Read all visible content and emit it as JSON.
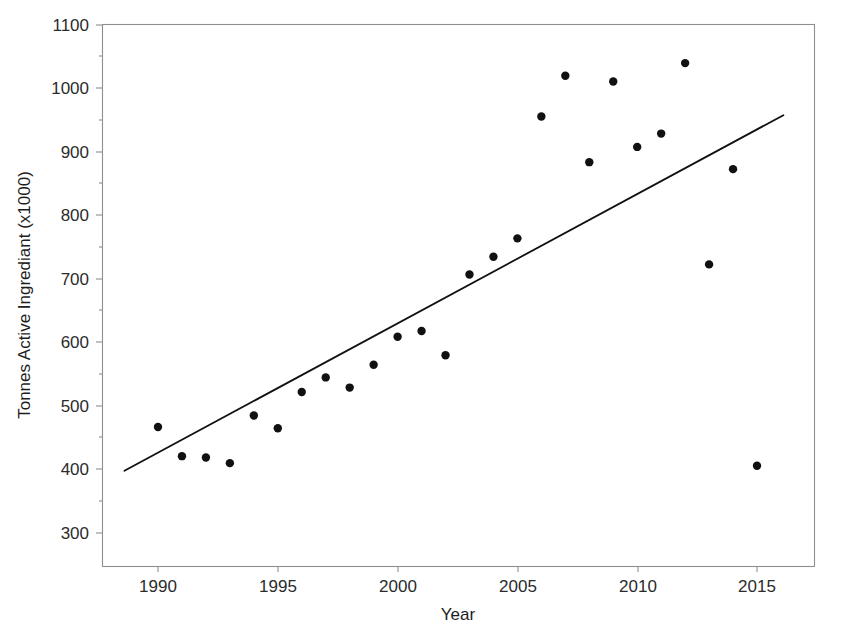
{
  "chart_data": {
    "type": "scatter",
    "title": "",
    "xlabel": "Year",
    "ylabel": "Tonnes Active Ingrediant (x1000)",
    "xlim": [
      1988.5,
      2016.5
    ],
    "ylim": [
      250,
      1100
    ],
    "grid": false,
    "legend": null,
    "xticks": [
      1990,
      1995,
      2000,
      2005,
      2010,
      2015
    ],
    "xtick_labels": [
      "1990",
      "1995",
      "2000",
      "2005",
      "2010",
      "2015"
    ],
    "yticks": [
      300,
      400,
      500,
      600,
      700,
      800,
      900,
      1000,
      1100
    ],
    "ytick_labels": [
      "300",
      "400",
      "500",
      "600",
      "700",
      "800",
      "900",
      "1000",
      "1100"
    ],
    "minor_yticks": [
      350,
      450,
      550,
      650,
      750,
      850,
      950,
      1050
    ],
    "x": [
      1990,
      1991,
      1992,
      1993,
      1994,
      1995,
      1996,
      1997,
      1998,
      1999,
      2000,
      2001,
      2002,
      2003,
      2004,
      2005,
      2006,
      2007,
      2008,
      2009,
      2010,
      2011,
      2012,
      2013,
      2014,
      2015
    ],
    "values": [
      467,
      421,
      419,
      410,
      485,
      465,
      522,
      545,
      529,
      565,
      609,
      618,
      580,
      707,
      735,
      764,
      956,
      1020,
      884,
      1011,
      908,
      929,
      1040,
      723,
      873,
      406
    ],
    "series": [
      {
        "name": "Tonnes Active Ingrediant",
        "marker": "filled-circle",
        "color": "#111111",
        "values": [
          467,
          421,
          419,
          410,
          485,
          465,
          522,
          545,
          529,
          565,
          609,
          618,
          580,
          707,
          735,
          764,
          956,
          1020,
          884,
          1011,
          908,
          929,
          1040,
          723,
          873,
          406
        ]
      }
    ],
    "trend_line": {
      "type": "linear-fit",
      "color": "#111111",
      "x_start": 1988.6,
      "y_start": 398,
      "x_end": 2016.1,
      "y_end": 958
    }
  },
  "axes": {
    "frame_color": "#8e8e8e",
    "tick_color": "#8e8e8e",
    "label_color": "#2b2b2b"
  }
}
